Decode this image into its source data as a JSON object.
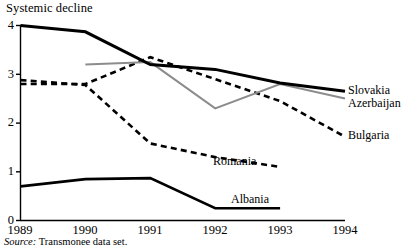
{
  "chart_data": {
    "type": "line",
    "title": "Systemic decline",
    "xlabel": "",
    "ylabel": "",
    "x": [
      1989,
      1990,
      1991,
      1992,
      1993,
      1994
    ],
    "xtick_labels": [
      "1989",
      "1990",
      "1991",
      "1992",
      "1993",
      "1994"
    ],
    "ytick_labels": [
      "0",
      "1",
      "2",
      "3",
      "4"
    ],
    "ytick_values": [
      0,
      1,
      2,
      3,
      4
    ],
    "xlim": [
      1989,
      1994
    ],
    "ylim": [
      0,
      4
    ],
    "grid": false,
    "legend": "inline-end-of-line labels",
    "series": [
      {
        "name": "Slovakia",
        "style": "solid",
        "color": "#000000",
        "width": 3.0,
        "x": [
          1989,
          1990,
          1991,
          1992,
          1993,
          1994
        ],
        "values": [
          4.0,
          3.87,
          3.2,
          3.1,
          2.82,
          2.65
        ],
        "label_x": 1994,
        "label_y": 2.72
      },
      {
        "name": "Azerbaijan",
        "style": "solid",
        "color": "#8c8c8c",
        "width": 2.0,
        "x": [
          1990,
          1991,
          1992,
          1993,
          1994
        ],
        "values": [
          3.2,
          3.25,
          2.3,
          2.8,
          2.5
        ],
        "label_x": 1994,
        "label_y": 2.42
      },
      {
        "name": "Bulgaria",
        "style": "dashed",
        "color": "#000000",
        "width": 2.6,
        "x": [
          1989,
          1990,
          1991,
          1992,
          1993,
          1994
        ],
        "values": [
          2.8,
          2.8,
          3.35,
          2.9,
          2.45,
          1.72
        ],
        "label_x": 1994,
        "label_y": 1.68
      },
      {
        "name": "Romania",
        "style": "dashed",
        "color": "#000000",
        "width": 2.6,
        "x": [
          1989,
          1990,
          1991,
          1992,
          1993
        ],
        "values": [
          2.88,
          2.78,
          1.58,
          1.3,
          1.1
        ],
        "label_x": 1993,
        "label_y": 1.13
      },
      {
        "name": "Albania",
        "style": "solid",
        "color": "#000000",
        "width": 2.6,
        "x": [
          1989,
          1990,
          1991,
          1992,
          1993
        ],
        "values": [
          0.7,
          0.85,
          0.87,
          0.25,
          0.25
        ],
        "label_x": 1993,
        "label_y": 0.42
      }
    ]
  },
  "axis": {
    "y_ticks": [
      {
        "label": "4"
      },
      {
        "label": "3"
      },
      {
        "label": "2"
      },
      {
        "label": "1"
      },
      {
        "label": "0"
      }
    ],
    "x_ticks": [
      {
        "label": "1989"
      },
      {
        "label": "1990"
      },
      {
        "label": "1991"
      },
      {
        "label": "1992"
      },
      {
        "label": "1993"
      },
      {
        "label": "1994"
      }
    ]
  },
  "labels": {
    "slovakia": "Slovakia",
    "azerbaijan": "Azerbaijan",
    "bulgaria": "Bulgaria",
    "romania": "Romania",
    "albania": "Albania"
  },
  "source": {
    "key": "Source:",
    "value": "Transmonee data set."
  }
}
